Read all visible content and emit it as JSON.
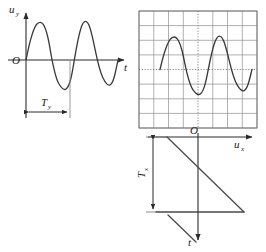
{
  "figure": {
    "title": "",
    "colors": {
      "curve": "#3a3a3a",
      "axis": "#2b2b2b",
      "grid": "#8f8f8f",
      "grid_center": "#8f8f8f",
      "label": "#1a1a1a",
      "background": "#ffffff"
    }
  },
  "left_plot": {
    "name": "vertical-deflection-signal",
    "y_axis_label": "u",
    "y_axis_sub": "y",
    "x_axis_label": "t",
    "origin_label": "O",
    "period_label": "T",
    "period_sub": "y",
    "waveform": {
      "type": "sine",
      "cycles": 2.25,
      "phase_deg": 0,
      "amplitude": 40,
      "period_px": 44,
      "start_x": 26,
      "baseline_y": 60,
      "end_x": 118
    }
  },
  "screen": {
    "name": "oscilloscope-screen",
    "grid_cols": 8,
    "grid_rows": 8,
    "left": 139,
    "top": 11,
    "width": 118,
    "height": 117,
    "center_lines": "dotted",
    "waveform": {
      "type": "sine",
      "cycles": 2.25,
      "amplitude": 34,
      "period_px": 44,
      "start_x": 160,
      "baseline_y": 69.5,
      "end_x": 252
    }
  },
  "x_axis": {
    "name": "horizontal-deflection-axis",
    "label": "u",
    "sub": "x",
    "origin_label": "O",
    "y": 137,
    "x_start": 150,
    "x_end": 250
  },
  "sweep_plot": {
    "name": "horizontal-sweep-sawtooth",
    "time_axis_label": "t",
    "period_label": "T",
    "period_sub": "x",
    "waveform": {
      "type": "sawtooth",
      "ramps": 1.4,
      "ramp_top_y": 137,
      "ramp_bottom_y": 212,
      "ramp_start_x": 196,
      "ramp_end_x": 244,
      "retrace_x_left": 156,
      "retrace_y": 212
    },
    "period_marker": {
      "x": 153,
      "y_top": 137,
      "y_bottom": 212
    }
  }
}
